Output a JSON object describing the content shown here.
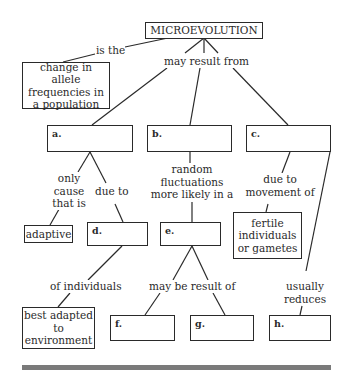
{
  "title": "MICROEVOLUTION",
  "definition": {
    "link": "is the",
    "text": "change in allele frequencies in a population"
  },
  "root_link": "may result from",
  "blanks": {
    "a": "a.",
    "b": "b.",
    "c": "c.",
    "d": "d.",
    "e": "e.",
    "f": "f.",
    "g": "g.",
    "h": "h."
  },
  "a_branch": {
    "link_left": "only cause that is",
    "adaptive": "adaptive",
    "link_right": "due to",
    "d_link": "of individuals",
    "best_adapted": "best adapted to environment"
  },
  "b_branch": {
    "link": "random fluctuations more likely in a",
    "e_link": "may be result of"
  },
  "c_branch": {
    "link": "due to movement of",
    "fertile": "fertile individuals or gametes",
    "link_h": "usually reduces"
  }
}
